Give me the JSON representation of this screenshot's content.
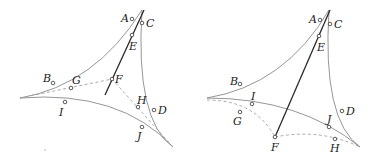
{
  "figures": [
    {
      "id": "left",
      "labels": {
        "A": "A",
        "B": "B",
        "C": "C",
        "D": "D",
        "E": "E",
        "F": "F",
        "G": "G",
        "H": "H",
        "I": "I",
        "J": "J"
      }
    },
    {
      "id": "right",
      "labels": {
        "A": "A",
        "B": "B",
        "C": "C",
        "D": "D",
        "E": "E",
        "F": "F",
        "G": "G",
        "H": "H",
        "I": "I",
        "J": "J"
      }
    }
  ],
  "colors": {
    "curve": "#8a8a8a",
    "dashed": "#a0a0a0",
    "line": "#2a2a2a",
    "text": "#222222"
  }
}
